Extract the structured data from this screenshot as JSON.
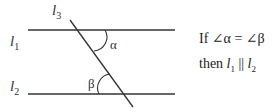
{
  "diagram": {
    "lines": {
      "l1": {
        "label": "l",
        "sub": "1"
      },
      "l2": {
        "label": "l",
        "sub": "2"
      },
      "l3": {
        "label": "l",
        "sub": "3"
      }
    },
    "angles": {
      "alpha": "α",
      "beta": "β"
    },
    "statement": {
      "line1_prefix": "If ",
      "angle_symbol": "∠",
      "alpha": "α",
      "equals": " = ",
      "beta": "β",
      "line2_prefix": "then ",
      "parallel": " || "
    },
    "colors": {
      "line": "#333333",
      "background": "#ffffff"
    }
  }
}
